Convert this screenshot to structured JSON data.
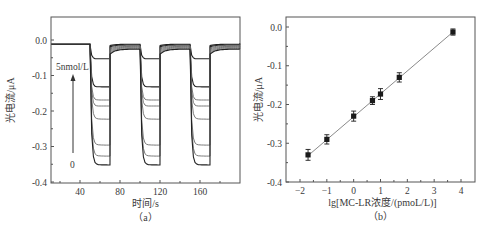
{
  "chart_data": [
    {
      "panel": "(a)",
      "type": "line",
      "title": "",
      "xlabel": "时间/s",
      "ylabel": "光电流/μA",
      "xlim": [
        11,
        200
      ],
      "ylim": [
        -0.4,
        0.06
      ],
      "xticks": [
        40,
        80,
        120,
        160
      ],
      "yticks": [
        0.0,
        -0.1,
        -0.2,
        -0.3,
        -0.4
      ],
      "ytick_labels": [
        "0.0",
        "-0.1",
        "-0.2",
        "-0.3",
        "-0.4"
      ],
      "grid": false,
      "light_on_intervals": [
        [
          50,
          70
        ],
        [
          100,
          120
        ],
        [
          150,
          170
        ]
      ],
      "baseline": -0.012,
      "annotation_top": "5nmol/L",
      "annotation_bottom": "0",
      "series": [
        {
          "name": "5nmol/L",
          "on_level": -0.053,
          "off_level": -0.012
        },
        {
          "name": "c6",
          "on_level": -0.132,
          "off_level": -0.014
        },
        {
          "name": "c5",
          "on_level": -0.169,
          "off_level": -0.016
        },
        {
          "name": "c4",
          "on_level": -0.186,
          "off_level": -0.018
        },
        {
          "name": "c3",
          "on_level": -0.223,
          "off_level": -0.02
        },
        {
          "name": "c2",
          "on_level": -0.296,
          "off_level": -0.022
        },
        {
          "name": "c1",
          "on_level": -0.327,
          "off_level": -0.024
        },
        {
          "name": "0",
          "on_level": -0.352,
          "off_level": -0.026
        }
      ]
    },
    {
      "panel": "(b)",
      "type": "scatter",
      "title": "",
      "xlabel": "lg[MC-LR浓度/(pmoL/L)]",
      "ylabel": "光电流/μA",
      "xlim": [
        -2.5,
        4.5
      ],
      "ylim": [
        -0.4,
        0.05
      ],
      "xticks": [
        -2,
        -1,
        0,
        1,
        2,
        3,
        4
      ],
      "yticks": [
        0.0,
        -0.1,
        -0.2,
        -0.3,
        -0.4
      ],
      "ytick_labels": [
        "0.0",
        "-0.1",
        "-0.2",
        "-0.3",
        "-0.4"
      ],
      "grid": false,
      "x": [
        -1.7,
        -1.0,
        0.0,
        0.7,
        1.0,
        1.7,
        3.7
      ],
      "y": [
        -0.33,
        -0.29,
        -0.23,
        -0.19,
        -0.173,
        -0.13,
        -0.013
      ],
      "error": [
        0.014,
        0.012,
        0.013,
        0.01,
        0.014,
        0.012,
        0.008
      ],
      "fit_line": {
        "x": [
          -1.7,
          3.7
        ],
        "y": [
          -0.332,
          -0.013
        ]
      }
    }
  ],
  "labels": {
    "panel_a": "（a）",
    "panel_b": "（b）"
  },
  "colors": {
    "axis": "#555555",
    "trace_dark": "#222222",
    "trace_mid": "#6b6b6b",
    "fit_line": "#8a8a8a",
    "marker": "#1a1a1a"
  }
}
